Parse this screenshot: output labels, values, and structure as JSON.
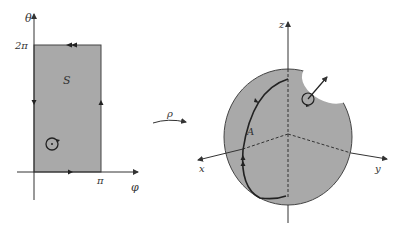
{
  "left_panel": {
    "axis_vertical_label": "θ",
    "axis_horizontal_label": "φ",
    "tick_y_label": "2π",
    "tick_x_label": "π",
    "region_label": "S",
    "region_fill": "#a9a9a9"
  },
  "map_arrow": {
    "label": "ρ"
  },
  "right_panel": {
    "axis_z_label": "z",
    "axis_x_label": "x",
    "axis_y_label": "y",
    "curve_label": "A",
    "sphere_fill": "#a9a9a9",
    "cap_fill": "#ffffff"
  },
  "colors": {
    "line": "#333333",
    "background": "#ffffff"
  }
}
